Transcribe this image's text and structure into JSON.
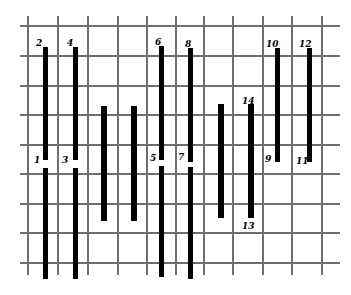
{
  "diagram": {
    "type": "grid-with-bars",
    "colors": {
      "grid": "#6e6e6e",
      "bar": "#000000",
      "background": "#ffffff"
    },
    "grid": {
      "vertical_x": [
        28,
        58,
        88,
        118,
        147,
        176,
        204,
        233,
        263,
        292,
        322
      ],
      "vertical_y_range": [
        16,
        275
      ],
      "horizontal_y": [
        26,
        56,
        86,
        115,
        145,
        174,
        204,
        233,
        263
      ],
      "horizontal_x_range": [
        20,
        340
      ]
    },
    "bars": [
      {
        "id": "bar-2",
        "x": 43,
        "w": 5,
        "y1": 47,
        "y2": 160
      },
      {
        "id": "bar-1",
        "x": 43,
        "w": 5,
        "y1": 168,
        "y2": 279
      },
      {
        "id": "bar-4",
        "x": 73,
        "w": 5,
        "y1": 47,
        "y2": 160
      },
      {
        "id": "bar-3",
        "x": 73,
        "w": 5,
        "y1": 168,
        "y2": 279
      },
      {
        "id": "bar-mid-a",
        "x": 101,
        "w": 6,
        "y1": 106,
        "y2": 221
      },
      {
        "id": "bar-mid-b",
        "x": 131,
        "w": 6,
        "y1": 106,
        "y2": 221
      },
      {
        "id": "bar-6",
        "x": 159,
        "w": 5,
        "y1": 46,
        "y2": 160
      },
      {
        "id": "bar-5",
        "x": 159,
        "w": 5,
        "y1": 166,
        "y2": 277
      },
      {
        "id": "bar-8",
        "x": 188,
        "w": 5,
        "y1": 48,
        "y2": 162
      },
      {
        "id": "bar-7",
        "x": 188,
        "w": 5,
        "y1": 167,
        "y2": 279
      },
      {
        "id": "bar-mid-c",
        "x": 218,
        "w": 6,
        "y1": 104,
        "y2": 218
      },
      {
        "id": "bar-14-13",
        "x": 248,
        "w": 6,
        "y1": 104,
        "y2": 218
      },
      {
        "id": "bar-10-9",
        "x": 275,
        "w": 5,
        "y1": 48,
        "y2": 162
      },
      {
        "id": "bar-12-11",
        "x": 307,
        "w": 5,
        "y1": 48,
        "y2": 162
      }
    ],
    "labels": [
      {
        "text": "2",
        "x": 36,
        "y": 39
      },
      {
        "text": "4",
        "x": 67,
        "y": 39
      },
      {
        "text": "6",
        "x": 155,
        "y": 38
      },
      {
        "text": "8",
        "x": 185,
        "y": 40
      },
      {
        "text": "10",
        "x": 266,
        "y": 40
      },
      {
        "text": "12",
        "x": 299,
        "y": 40
      },
      {
        "text": "14",
        "x": 242,
        "y": 97
      },
      {
        "text": "1",
        "x": 34,
        "y": 156
      },
      {
        "text": "3",
        "x": 62,
        "y": 156
      },
      {
        "text": "5",
        "x": 150,
        "y": 154
      },
      {
        "text": "7",
        "x": 178,
        "y": 153
      },
      {
        "text": "9",
        "x": 265,
        "y": 155
      },
      {
        "text": "11",
        "x": 296,
        "y": 157
      },
      {
        "text": "13",
        "x": 242,
        "y": 222
      }
    ]
  }
}
